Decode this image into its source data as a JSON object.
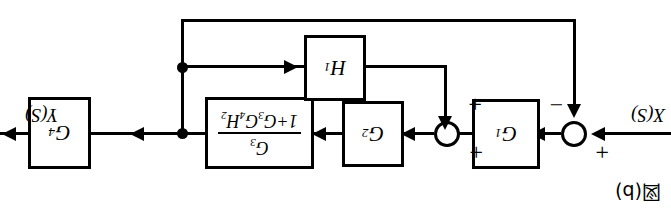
{
  "figure": {
    "caption": "図(b)",
    "orientation": "rotated-180"
  },
  "io": {
    "input_label": "X(S)",
    "output_label": "Y(S)"
  },
  "blocks": {
    "g1": {
      "name": "G",
      "sub": "1"
    },
    "g2": {
      "name": "G",
      "sub": "2"
    },
    "g4": {
      "name": "G",
      "sub": "4"
    },
    "h1": {
      "name": "H",
      "sub": "1"
    },
    "fraction": {
      "numerator": "G",
      "numerator_sub": "3",
      "den_lead": "1+G",
      "den_s1": "3",
      "den_mid": "G",
      "den_s2": "4",
      "den_tail": "H",
      "den_s3": "2"
    }
  },
  "summers": {
    "sum1": {
      "sign_feedback": "−",
      "sign_input": "+"
    },
    "sum2": {
      "sign_top": "+",
      "sign_bottom": "+"
    }
  },
  "colors": {
    "line": "#000000",
    "background": "#ffffff"
  }
}
